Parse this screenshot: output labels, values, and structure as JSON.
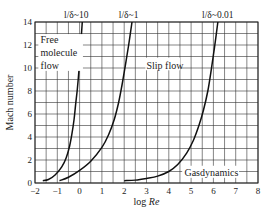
{
  "chart_data": {
    "type": "line",
    "title": "",
    "xlabel": "log Re",
    "xlabel_plain": "log ",
    "xlabel_italic": "Re",
    "ylabel": "Mach number",
    "xlim": [
      -2,
      8
    ],
    "ylim": [
      0,
      14
    ],
    "grid": true,
    "x_grid_step": 0.5,
    "y_grid_step": 1,
    "x_ticks": [
      -2,
      -1,
      0,
      1,
      2,
      3,
      4,
      5,
      6,
      7,
      8
    ],
    "y_ticks": [
      0,
      2,
      4,
      6,
      8,
      10,
      12,
      14
    ],
    "series": [
      {
        "name": "l/δ~10",
        "x": [
          -1.65,
          -1.4,
          -1.1,
          -0.8,
          -0.6,
          -0.45,
          -0.35,
          -0.25,
          -0.18,
          -0.1,
          -0.02,
          0.05,
          0.12
        ],
        "y": [
          0.2,
          0.3,
          0.7,
          1.4,
          2.2,
          3.2,
          4.2,
          5.5,
          6.8,
          8.2,
          10.0,
          12.0,
          14.0
        ]
      },
      {
        "name": "l/δ~1",
        "x": [
          -0.9,
          -0.5,
          0.0,
          0.5,
          1.0,
          1.3,
          1.55,
          1.75,
          1.9,
          2.05,
          2.2,
          2.35
        ],
        "y": [
          0.2,
          0.5,
          1.1,
          1.9,
          3.1,
          4.2,
          5.5,
          7.0,
          8.5,
          10.2,
          12.0,
          14.0
        ]
      },
      {
        "name": "l/δ~0.01",
        "x": [
          2.0,
          2.5,
          3.0,
          3.5,
          4.0,
          4.4,
          4.8,
          5.1,
          5.35,
          5.55,
          5.75,
          5.9,
          6.05,
          6.2
        ],
        "y": [
          0.2,
          0.25,
          0.4,
          0.6,
          1.0,
          1.6,
          2.6,
          3.7,
          5.0,
          6.3,
          8.0,
          9.8,
          11.8,
          14.0
        ]
      }
    ],
    "annotations": [
      {
        "text": "l/δ~10",
        "x": -0.15,
        "y": 14.5
      },
      {
        "text": "l/δ~1",
        "x": 2.2,
        "y": 14.5
      },
      {
        "text": "l/δ~0.01",
        "x": 6.2,
        "y": 14.5
      },
      {
        "text": "Free",
        "x": -1.75,
        "y": 12.4
      },
      {
        "text": "molecule",
        "x": -1.75,
        "y": 11.3
      },
      {
        "text": "flow",
        "x": -1.75,
        "y": 10.2
      },
      {
        "text": "Slip flow",
        "x": 3.0,
        "y": 10.2
      },
      {
        "text": "Gasdynamics",
        "x": 4.7,
        "y": 0.9
      }
    ],
    "legend": "none (curves labeled inline)"
  }
}
